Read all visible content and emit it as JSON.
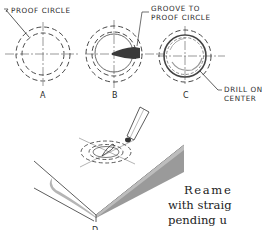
{
  "figure": {
    "callouts": {
      "proof_circle": "PROOF CIRCLE",
      "groove_line1": "GROOVE TO",
      "groove_line2": "PROOF CIRCLE",
      "drill_line1": "DRILL ON",
      "drill_line2": "CENTER"
    },
    "panels": [
      {
        "id": "A",
        "label": "A",
        "caption": "proof circle around center"
      },
      {
        "id": "B",
        "label": "B",
        "caption": "groove cut to proof circle"
      },
      {
        "id": "C",
        "label": "C",
        "caption": "drill on center"
      },
      {
        "id": "D",
        "label": "D",
        "caption": "chisel cutting groove on workpiece"
      }
    ]
  },
  "body_text": {
    "lines": [
      "Reame",
      "with straig",
      "pending u",
      "ting actio"
    ]
  }
}
